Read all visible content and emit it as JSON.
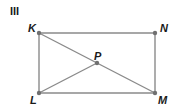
{
  "figure": {
    "label": "III",
    "shape": "rectangle",
    "points": [
      {
        "id": "K",
        "label": "K"
      },
      {
        "id": "N",
        "label": "N"
      },
      {
        "id": "L",
        "label": "L"
      },
      {
        "id": "M",
        "label": "M"
      },
      {
        "id": "P",
        "label": "P"
      }
    ],
    "segments": [
      {
        "from": "K",
        "to": "N"
      },
      {
        "from": "N",
        "to": "M"
      },
      {
        "from": "M",
        "to": "L"
      },
      {
        "from": "L",
        "to": "K"
      },
      {
        "from": "K",
        "to": "M"
      },
      {
        "from": "L",
        "to": "P"
      }
    ],
    "colors": {
      "line": "#8a8a8a",
      "point": "#707070",
      "text": "#1a1a1a"
    }
  }
}
